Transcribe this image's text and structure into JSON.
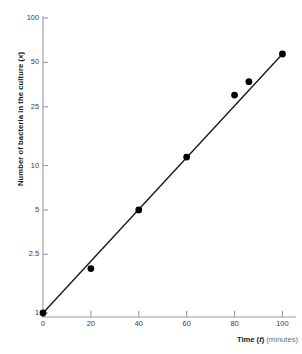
{
  "chart_data": {
    "type": "scatter",
    "title": "",
    "subtitle": "",
    "xlabel_strong": "Time (t)",
    "xlabel_soft": "(minutes)",
    "xlabel_variable": "t",
    "ylabel": "Number of bacteria in the culture (x)",
    "ylabel_variable": "x",
    "xscale": "linear",
    "yscale": "log",
    "xlim": [
      0,
      104
    ],
    "ylim": [
      1,
      100
    ],
    "grid": false,
    "legend": false,
    "legend_position": "none",
    "xticks": [
      0,
      20,
      40,
      60,
      80,
      100
    ],
    "xtick_labels": [
      "0",
      "20",
      "40",
      "60",
      "80",
      "100"
    ],
    "yticks": [
      1,
      2.5,
      5,
      10,
      25,
      50,
      100
    ],
    "ytick_labels": [
      "1",
      "2.5",
      "5",
      "10",
      "25",
      "50",
      "100"
    ],
    "series": [
      {
        "name": "bacteria count",
        "marker": "filled-circle",
        "marker_color": "#000000",
        "line_color": "#1a1a1a",
        "x": [
          0,
          20,
          40,
          60,
          80,
          86,
          100
        ],
        "y": [
          1,
          2,
          5,
          11.4,
          30,
          37,
          57
        ]
      }
    ],
    "fit_line": {
      "name": "best-fit straight line",
      "x": [
        0,
        100
      ],
      "y": [
        1,
        57
      ]
    },
    "colors": {
      "axis": "#9a9a9e",
      "data": "#000000",
      "text": "#17171a",
      "muted_text": "#6e6e72",
      "background": "#ffffff"
    }
  }
}
